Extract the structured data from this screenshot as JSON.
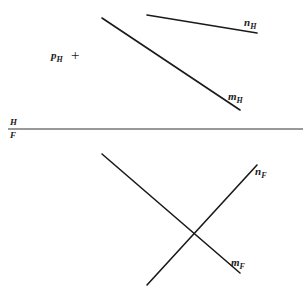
{
  "diagram": {
    "stroke_color": "#1a1a1a",
    "fold_line": {
      "label_top": "H",
      "label_bottom": "F",
      "x1": 8,
      "y1": 129,
      "x2": 303,
      "y2": 129
    },
    "point_p": {
      "label": "p",
      "subscript": "H",
      "marker": "+"
    },
    "lines": {
      "n_H": {
        "label": "n",
        "subscript": "H",
        "x1": 147,
        "y1": 15,
        "x2": 257,
        "y2": 33
      },
      "m_H": {
        "label": "m",
        "subscript": "H",
        "x1": 102,
        "y1": 18,
        "x2": 240,
        "y2": 110
      },
      "m_F": {
        "label": "m",
        "subscript": "F",
        "x1": 102,
        "y1": 154,
        "x2": 240,
        "y2": 273
      },
      "n_F": {
        "label": "n",
        "subscript": "F",
        "x1": 147,
        "y1": 285,
        "x2": 257,
        "y2": 165
      }
    }
  }
}
